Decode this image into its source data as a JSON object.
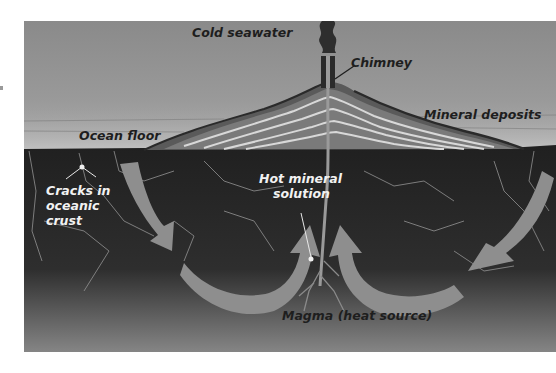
{
  "diagram": {
    "labels": {
      "cold_seawater": "Cold seawater",
      "chimney": "Chimney",
      "mineral_deposits": "Mineral deposits",
      "ocean_floor": "Ocean floor",
      "cracks_line1": "Cracks in",
      "cracks_line2": "oceanic",
      "cracks_line3": "crust",
      "hot_solution_line1": "Hot mineral",
      "hot_solution_line2": "solution",
      "magma": "Magma (heat source)"
    },
    "colors": {
      "seawater_top": "#8a8a8a",
      "seawater_bottom": "#a8a8a8",
      "crust_top": "#232323",
      "crust_bottom": "#7a7a7a",
      "arrow": "#8e8e8e",
      "mound_light": "#bdbdbd",
      "mound_dark": "#3a3a3a"
    },
    "flow_arrows": [
      {
        "id": "left-down",
        "direction": "down"
      },
      {
        "id": "left-u-turn",
        "direction": "up-toward-center"
      },
      {
        "id": "right-u-turn",
        "direction": "up-toward-center"
      },
      {
        "id": "right-down",
        "direction": "down"
      }
    ]
  }
}
